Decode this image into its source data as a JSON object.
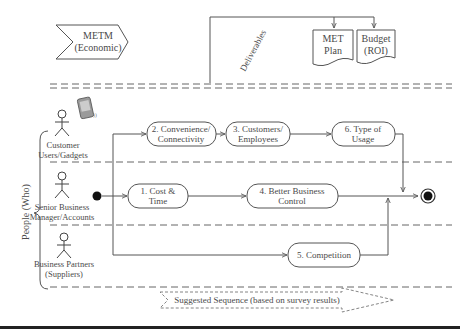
{
  "economic_box": {
    "line1": "METM",
    "line2": "(Economic)"
  },
  "deliverables_label": "Deliverables",
  "documents": [
    {
      "line1": "MET",
      "line2": "Plan"
    },
    {
      "line1": "Budget",
      "line2": "(ROI)"
    }
  ],
  "swimlane_group_label": "People (Who)",
  "actors": [
    {
      "line1": "Customer",
      "line2": "Users/Gadgets"
    },
    {
      "line1": "Senior Business",
      "line2": "Manager/Accounts"
    },
    {
      "line1": "Business Partners",
      "line2": "(Suppliers)"
    }
  ],
  "activities": [
    {
      "id": "n1",
      "line1": "1. Cost &",
      "line2": "Time"
    },
    {
      "id": "n2",
      "line1": "2. Convenience/",
      "line2": "Connectivity"
    },
    {
      "id": "n3",
      "line1": "3. Customers/",
      "line2": "Employees"
    },
    {
      "id": "n4",
      "line1": "4. Better Business",
      "line2": "Control"
    },
    {
      "id": "n5",
      "line1": "5. Competition",
      "line2": ""
    },
    {
      "id": "n6",
      "line1": "6. Type of",
      "line2": "Usage"
    }
  ],
  "legend": {
    "label": "Suggested Sequence (based on survey results)"
  },
  "colors": {
    "line": "#555555",
    "text": "#4a4a4a",
    "dash": "#666666"
  }
}
